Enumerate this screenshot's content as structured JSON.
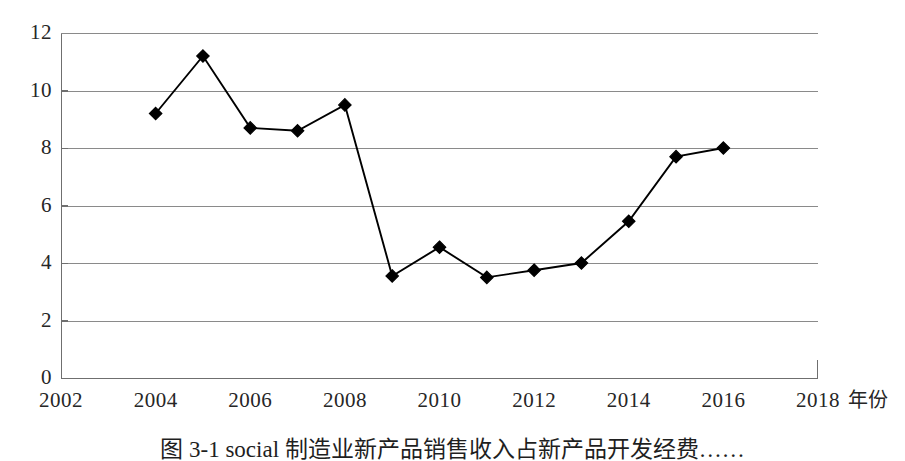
{
  "chart_data": {
    "type": "line",
    "title": "",
    "xlabel": "年份",
    "ylabel": "",
    "xlim": [
      2002,
      2018
    ],
    "ylim": [
      0,
      12
    ],
    "grid": true,
    "legend": "none",
    "marker": "diamond",
    "x_ticks": [
      "2002",
      "2004",
      "2006",
      "2008",
      "2010",
      "2012",
      "2014",
      "2016",
      "2018"
    ],
    "y_ticks": [
      "0",
      "2",
      "4",
      "6",
      "8",
      "10",
      "12"
    ],
    "x": [
      2004,
      2005,
      2006,
      2007,
      2008,
      2009,
      2010,
      2011,
      2012,
      2013,
      2014,
      2015,
      2016
    ],
    "values": [
      9.2,
      11.2,
      8.7,
      8.6,
      9.5,
      3.55,
      4.55,
      3.5,
      3.75,
      4.0,
      5.45,
      7.7,
      8.0
    ],
    "series": [
      {
        "name": "",
        "color": "#000000",
        "values": [
          9.2,
          11.2,
          8.7,
          8.6,
          9.5,
          3.55,
          4.55,
          3.5,
          3.75,
          4.0,
          5.45,
          7.7,
          8.0
        ]
      }
    ]
  },
  "axis": {
    "x_title": "年份"
  },
  "caption": {
    "text": "图 3-1  social 制造业新产品销售收入占新产品开发经费……"
  },
  "colors": {
    "line": "#000000",
    "marker": "#000000",
    "grid": "#8a8a8a",
    "frame": "#6f6f6f",
    "text": "#262626",
    "background": "#ffffff"
  }
}
